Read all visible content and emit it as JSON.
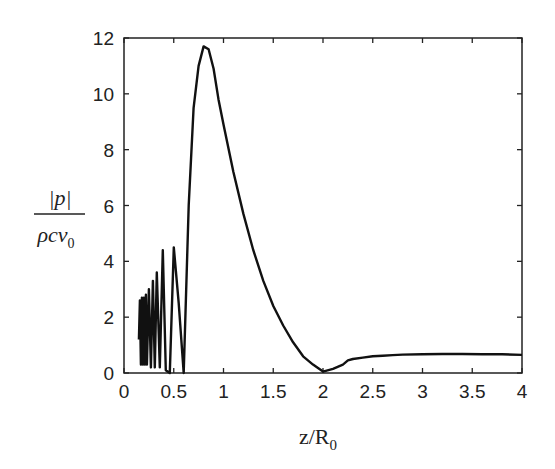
{
  "chart_data": {
    "type": "line",
    "title": "",
    "xlabel": "z/R0",
    "xlabel_main": "z/R",
    "xlabel_sub": "0",
    "ylabel": "|p| / (ρ c v0)",
    "ylabel_numerator": "|p|",
    "ylabel_denominator": "ρcv",
    "ylabel_denominator_sub": "0",
    "xlim": [
      0,
      4
    ],
    "ylim": [
      0,
      12
    ],
    "xticks": [
      "0",
      "0.5",
      "1",
      "1.5",
      "2",
      "2.5",
      "3",
      "3.5",
      "4"
    ],
    "yticks": [
      "0",
      "2",
      "4",
      "6",
      "8",
      "10",
      "12"
    ],
    "grid": false,
    "legend": null,
    "series": [
      {
        "name": "normalized pressure amplitude",
        "color": "#111111",
        "x": [
          0.15,
          0.16,
          0.17,
          0.18,
          0.19,
          0.2,
          0.21,
          0.22,
          0.23,
          0.25,
          0.27,
          0.29,
          0.31,
          0.33,
          0.36,
          0.39,
          0.42,
          0.46,
          0.5,
          0.55,
          0.6,
          0.65,
          0.7,
          0.75,
          0.8,
          0.85,
          0.9,
          0.95,
          1.0,
          1.1,
          1.2,
          1.3,
          1.4,
          1.5,
          1.6,
          1.7,
          1.8,
          1.9,
          2.0,
          2.1,
          2.2,
          2.25,
          2.3,
          2.4,
          2.5,
          2.6,
          2.7,
          2.8,
          3.0,
          3.2,
          3.4,
          3.6,
          3.8,
          4.0
        ],
        "y": [
          1.2,
          2.6,
          0.3,
          2.7,
          0.3,
          2.7,
          0.3,
          2.8,
          0.3,
          3.0,
          0.2,
          3.3,
          0.2,
          3.6,
          0.2,
          4.4,
          0.1,
          0.0,
          4.5,
          2.5,
          0.0,
          6.0,
          9.5,
          11.0,
          11.7,
          11.6,
          10.9,
          9.8,
          8.9,
          7.2,
          5.7,
          4.4,
          3.3,
          2.4,
          1.7,
          1.1,
          0.6,
          0.3,
          0.05,
          0.15,
          0.3,
          0.45,
          0.5,
          0.55,
          0.6,
          0.62,
          0.64,
          0.66,
          0.67,
          0.68,
          0.68,
          0.67,
          0.67,
          0.65
        ]
      }
    ]
  }
}
